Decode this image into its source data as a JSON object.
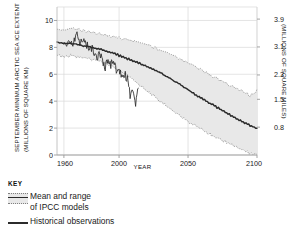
{
  "chart_data": {
    "type": "line",
    "title": "",
    "xlabel": "YEAR",
    "ylabel": "SEPTEMBER MINIMUM ARCTIC SEA ICE EXTENT (MILLIONS OF SQUARE KM)",
    "ylabel_left_line1": "SEPTEMBER MINIMUM ARCTIC SEA ICE EXTENT",
    "ylabel_left_line2": "(MILLIONS OF SQUARE KM)",
    "ylabel_right": "(MILLIONS OF SQUARE MILES)",
    "xlim": [
      1955,
      2100
    ],
    "ylim": [
      0,
      11
    ],
    "grid": true,
    "legend_position": "below-left",
    "xticks": [
      1960,
      2000,
      2050,
      2100
    ],
    "xticklabels": [
      "1960",
      "2000",
      "2050",
      "2100"
    ],
    "yticks": [
      0,
      2,
      4,
      6,
      8,
      10
    ],
    "yticklabels": [
      "0",
      "2",
      "4",
      "6",
      "8",
      "10"
    ],
    "y2ticks": [
      2.07,
      4.14,
      5.95,
      8.03,
      10.1
    ],
    "y2ticklabels": [
      "0.8",
      "1.5",
      "2.3",
      "3.1",
      "3.9"
    ],
    "series": [
      {
        "name": "Mean of IPCC models",
        "style": "solid-dark",
        "x": [
          1955,
          1960,
          1965,
          1970,
          1975,
          1980,
          1985,
          1990,
          1995,
          2000,
          2005,
          2010,
          2015,
          2020,
          2025,
          2030,
          2035,
          2040,
          2045,
          2050,
          2055,
          2060,
          2065,
          2070,
          2075,
          2080,
          2085,
          2090,
          2095,
          2100
        ],
        "values": [
          8.4,
          8.3,
          8.3,
          8.2,
          8.1,
          8.0,
          7.9,
          7.75,
          7.6,
          7.4,
          7.2,
          7.0,
          6.8,
          6.6,
          6.35,
          6.1,
          5.8,
          5.5,
          5.2,
          4.85,
          4.5,
          4.2,
          3.9,
          3.6,
          3.3,
          3.0,
          2.7,
          2.45,
          2.2,
          2.0
        ]
      },
      {
        "name": "IPCC models upper bound",
        "style": "dotted",
        "x": [
          1955,
          1960,
          1965,
          1970,
          1975,
          1980,
          1985,
          1990,
          1995,
          2000,
          2005,
          2010,
          2015,
          2020,
          2025,
          2030,
          2035,
          2040,
          2045,
          2050,
          2055,
          2060,
          2065,
          2070,
          2075,
          2080,
          2085,
          2090,
          2095,
          2100
        ],
        "values": [
          9.4,
          9.3,
          9.4,
          9.3,
          9.2,
          9.1,
          9.0,
          8.9,
          8.8,
          8.7,
          8.6,
          8.5,
          8.35,
          8.2,
          8.0,
          7.8,
          7.6,
          7.35,
          7.1,
          6.85,
          6.6,
          6.3,
          6.0,
          5.7,
          5.45,
          5.2,
          4.95,
          4.7,
          4.4,
          4.8
        ]
      },
      {
        "name": "IPCC models lower bound",
        "style": "dotted",
        "x": [
          1955,
          1960,
          1965,
          1970,
          1975,
          1980,
          1985,
          1990,
          1995,
          2000,
          2005,
          2010,
          2015,
          2020,
          2025,
          2030,
          2035,
          2040,
          2045,
          2050,
          2055,
          2060,
          2065,
          2070,
          2075,
          2080,
          2085,
          2090,
          2095,
          2100
        ],
        "values": [
          7.4,
          7.3,
          7.4,
          7.3,
          7.2,
          7.1,
          7.0,
          6.8,
          6.6,
          6.3,
          6.0,
          5.6,
          5.2,
          4.8,
          4.4,
          4.0,
          3.6,
          3.2,
          2.85,
          2.5,
          2.2,
          1.9,
          1.6,
          1.35,
          1.1,
          0.85,
          0.6,
          0.35,
          0.1,
          0.0
        ]
      },
      {
        "name": "Historical observations",
        "style": "solid-dark-jagged",
        "x": [
          1960,
          1962,
          1964,
          1966,
          1968,
          1970,
          1972,
          1974,
          1976,
          1978,
          1980,
          1982,
          1984,
          1986,
          1988,
          1990,
          1992,
          1994,
          1996,
          1998,
          2000,
          2002,
          2004,
          2006,
          2008,
          2010,
          2012,
          2014
        ],
        "values": [
          8.2,
          8.1,
          8.3,
          8.2,
          8.6,
          8.9,
          8.3,
          8.7,
          8.2,
          7.9,
          8.0,
          7.6,
          7.2,
          7.5,
          7.0,
          6.5,
          7.1,
          6.7,
          7.0,
          6.3,
          6.1,
          5.9,
          6.0,
          5.6,
          4.5,
          4.9,
          3.6,
          5.0
        ]
      }
    ]
  },
  "legend": {
    "title": "KEY",
    "items": [
      {
        "label_line1": "Mean and range",
        "label_line2": "of IPCC models",
        "swatch": "band-with-mean"
      },
      {
        "label_line1": "Historical observations",
        "label_line2": "",
        "swatch": "solid-line"
      }
    ]
  },
  "colors": {
    "band_fill": "#e8e8e8",
    "band_edge": "#8a8a8a",
    "line_dark": "#2b2b2b",
    "grid": "#d8d8d8",
    "axis": "#bdbdbd",
    "text": "#1a1a1a"
  }
}
